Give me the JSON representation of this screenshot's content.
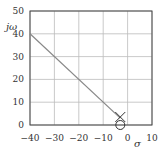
{
  "chart_data": {
    "type": "line",
    "title": "",
    "xlabel": "σ",
    "ylabel": "jω",
    "xlim": [
      -40,
      10
    ],
    "ylim": [
      0,
      50
    ],
    "xticks": [
      -40,
      -30,
      -20,
      -10,
      0,
      10
    ],
    "yticks": [
      0,
      10,
      20,
      30,
      40,
      50
    ],
    "xtick_labels": [
      "−40",
      "−30",
      "−20",
      "−10",
      "0",
      "10"
    ],
    "ytick_labels": [
      "0",
      "10",
      "20",
      "30",
      "40",
      "50"
    ],
    "grid": true,
    "series": [
      {
        "name": "root-locus",
        "x": [
          -40,
          -3
        ],
        "y": [
          40,
          3
        ],
        "color": "#888888"
      }
    ],
    "markers": [
      {
        "name": "pole",
        "symbol": "x",
        "x": -3,
        "y": 3.5
      },
      {
        "name": "zero",
        "symbol": "o",
        "x": -3,
        "y": 0
      }
    ]
  }
}
